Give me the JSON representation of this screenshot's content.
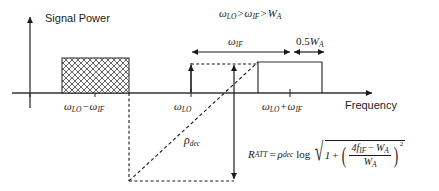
{
  "figure": {
    "axes": {
      "y_label": "Signal Power",
      "x_label": "Frequency"
    },
    "condition_note": {
      "omega_lo": "ω",
      "sub_lo": "LO",
      "gt1": ">",
      "omega_if": "ω",
      "sub_if": "IF",
      "gt2": ">",
      "w": "W",
      "sub_a": "A",
      "full": "ωLO > ωIF > WA"
    },
    "tick_labels": [
      {
        "name": "lower-sideband",
        "base1": "ω",
        "sub1": "LO",
        "op": "−",
        "base2": "ω",
        "sub2": "IF"
      },
      {
        "name": "lo-center",
        "base1": "ω",
        "sub1": "LO",
        "op": "",
        "base2": "",
        "sub2": ""
      },
      {
        "name": "upper-sideband",
        "base1": "ω",
        "sub1": "LO",
        "op": "+",
        "base2": "ω",
        "sub2": "IF"
      }
    ],
    "dimension_arrows": [
      {
        "name": "omega-if-span",
        "base": "ω",
        "sub": "IF"
      },
      {
        "name": "half-wa-span",
        "prefix": "0.5",
        "base": "W",
        "sub": "A"
      }
    ],
    "slope_label": {
      "base": "ρ",
      "sub": "dec"
    },
    "attenuation_formula": {
      "lhs_base": "R",
      "lhs_sub": "ATT",
      "equals": "=",
      "rho_base": "ρ",
      "rho_sub": "dec",
      "log": "log",
      "radical": "√",
      "one": "1",
      "plus": "+",
      "numerator_coeff": "4",
      "numerator_base": "f",
      "numerator_sub": "IF",
      "numerator_minus": "−",
      "numerator_w": "W",
      "numerator_w_sub": "A",
      "denominator_w": "W",
      "denominator_w_sub": "A",
      "exponent": "2",
      "plain": "R_ATT = ρ_dec log √(1 + ((4 f_IF − W_A)/W_A)^2)"
    }
  },
  "style": {
    "line_color": "#1a1a1a",
    "axis_color": "#333333",
    "hatch_color": "#555555",
    "dash_color": "#1a1a1a",
    "background": "#ffffff"
  }
}
